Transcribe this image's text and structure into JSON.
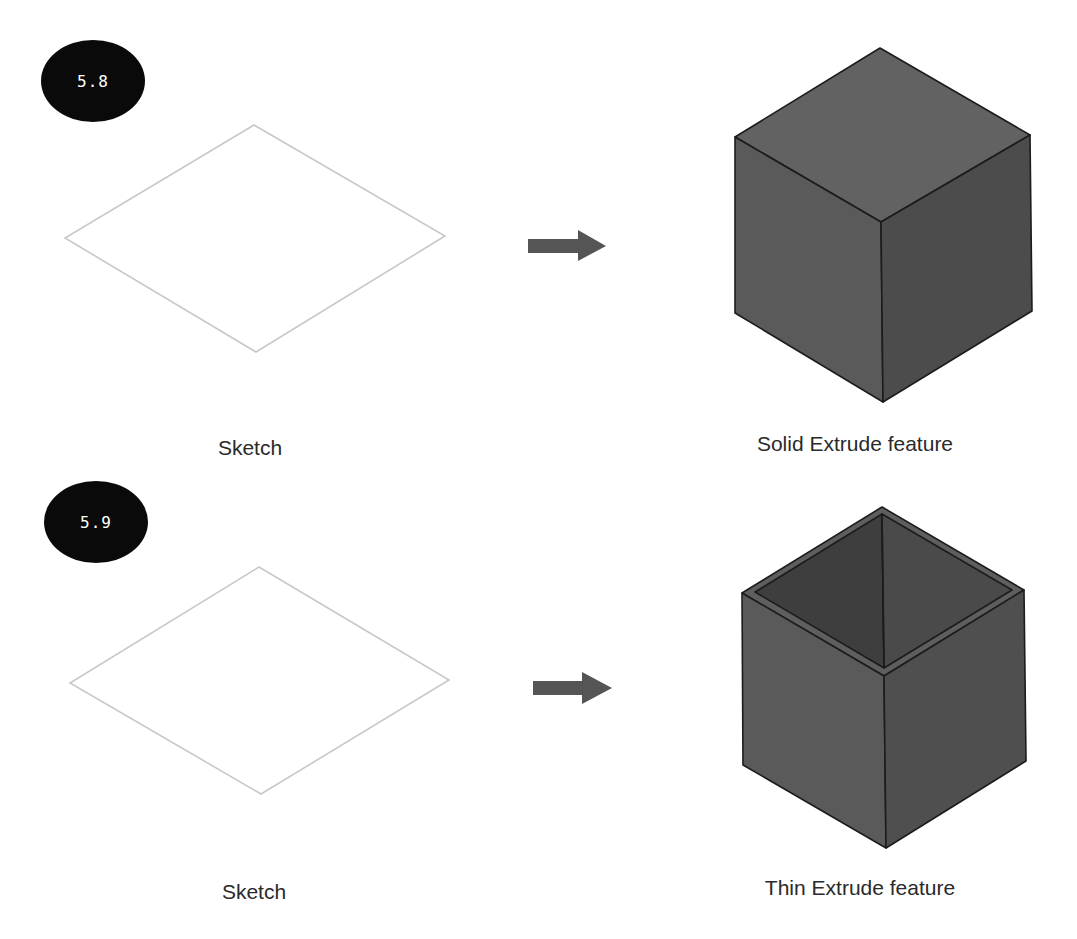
{
  "figures": [
    {
      "badge": "5.8",
      "sketch_label": "Sketch",
      "result_label": "Solid Extrude feature",
      "result_type": "solid"
    },
    {
      "badge": "5.9",
      "sketch_label": "Sketch",
      "result_label": "Thin Extrude feature",
      "result_type": "thin"
    }
  ],
  "colors": {
    "badge_bg": "#0a0a0a",
    "sketch_outline": "#c8c8c8",
    "arrow": "#555555",
    "cube_top": "#626262",
    "cube_left": "#5a5a5a",
    "cube_right": "#4c4c4c",
    "cube_edge": "#1c1c1c"
  }
}
